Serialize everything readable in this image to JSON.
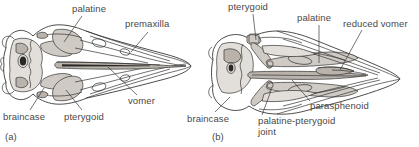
{
  "figure": {
    "type": "anatomical-line-drawing",
    "background_color": "#ffffff",
    "ink_color": "#2e2d2c",
    "label_color": "#4a4846"
  },
  "panels": [
    {
      "id": "panel-a",
      "caption": "(a)",
      "labels": [
        {
          "name": "palatine",
          "text": "palatine"
        },
        {
          "name": "premaxilla",
          "text": "premaxilla"
        },
        {
          "name": "vomer",
          "text": "vomer"
        },
        {
          "name": "braincase",
          "text": "braincase"
        },
        {
          "name": "pterygoid",
          "text": "pterygoid"
        }
      ]
    },
    {
      "id": "panel-b",
      "caption": "(b)",
      "labels": [
        {
          "name": "pterygoid",
          "text": "pterygoid"
        },
        {
          "name": "palatine",
          "text": "palatine"
        },
        {
          "name": "reduced-vomer",
          "text": "reduced vomer"
        },
        {
          "name": "parasphenoid",
          "text": "parasphenoid"
        },
        {
          "name": "palatine-pterygoid-joint",
          "text": "palatine-pterygoid joint"
        },
        {
          "name": "braincase",
          "text": "braincase"
        }
      ]
    }
  ],
  "text": {
    "a_palatine": "palatine",
    "a_premaxilla": "premaxilla",
    "a_vomer": "vomer",
    "a_braincase": "braincase",
    "a_pterygoid": "pterygoid",
    "a_caption": "(a)",
    "b_pterygoid": "pterygoid",
    "b_palatine": "palatine",
    "b_reduced_vomer": "reduced vomer",
    "b_parasphenoid": "parasphenoid",
    "b_joint_line1": "palatine-pterygoid",
    "b_joint_line2": "joint",
    "b_braincase": "braincase",
    "b_caption": "(b)"
  }
}
